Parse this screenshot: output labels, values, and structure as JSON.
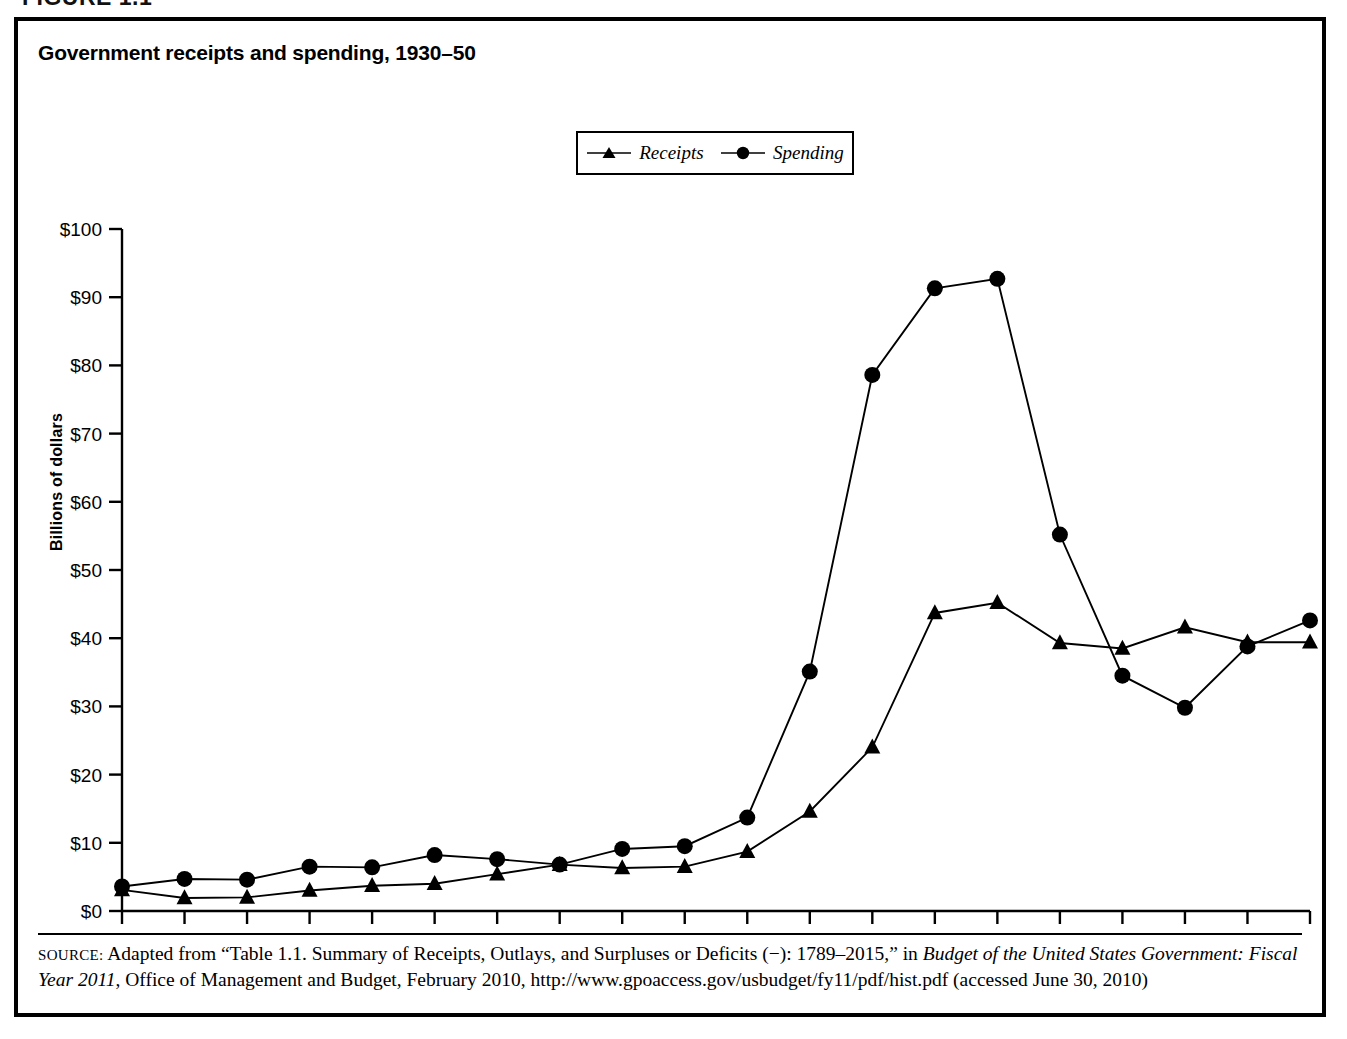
{
  "figure": {
    "number_label": "FIGURE 1.1",
    "title": "Government receipts and spending, 1930–50"
  },
  "legend": {
    "position": "top-center",
    "entries": [
      {
        "label": "Receipts",
        "marker": "triangle-marker-icon"
      },
      {
        "label": "Spending",
        "marker": "circle-marker-icon"
      }
    ]
  },
  "axes": {
    "y_label": "Billions of dollars",
    "y_ticks": [
      "$0",
      "$10",
      "$20",
      "$30",
      "$40",
      "$50",
      "$60",
      "$70",
      "$80",
      "$90",
      "$100"
    ],
    "x_ticks": [
      "1931",
      "1932",
      "1933",
      "1934",
      "1935",
      "1936",
      "1937",
      "1938",
      "1939",
      "1940",
      "1941",
      "1942",
      "1943",
      "1944",
      "1945",
      "1946",
      "1947",
      "1948",
      "1949",
      "1950"
    ]
  },
  "source": {
    "label": "SOURCE:",
    "line1_a": " Adapted from “Table 1.1. Summary of Receipts, Outlays, and Surpluses or Deficits (−): 1789–2015,” in ",
    "line1_italic": "Budget of the United States Government:",
    "line2_italic": "Fiscal Year 2011",
    "line2_b": ", Office of Management and Budget, February 2010, http://www.gpoaccess.gov/usbudget/fy11/pdf/hist.pdf (accessed June 30, 2010)"
  },
  "colors": {
    "line": "#000000",
    "marker": "#000000",
    "frame": "#000000",
    "background": "#ffffff"
  },
  "chart_data": {
    "type": "line",
    "title": "Government receipts and spending, 1930–50",
    "xlabel": "",
    "ylabel": "Billions of dollars",
    "xlim": [
      1931,
      1950
    ],
    "ylim": [
      0,
      100
    ],
    "ytick_step": 10,
    "grid": false,
    "legend_position": "top-center",
    "x": [
      1931,
      1932,
      1933,
      1934,
      1935,
      1936,
      1937,
      1938,
      1939,
      1940,
      1941,
      1942,
      1943,
      1944,
      1945,
      1946,
      1947,
      1948,
      1949,
      1950
    ],
    "series": [
      {
        "name": "Receipts",
        "marker": "triangle",
        "values": [
          3.1,
          1.9,
          2.0,
          3.0,
          3.7,
          4.0,
          5.4,
          6.8,
          6.3,
          6.5,
          8.7,
          14.6,
          24.0,
          43.7,
          45.2,
          39.3,
          38.5,
          41.6,
          39.4,
          39.4
        ]
      },
      {
        "name": "Spending",
        "marker": "circle",
        "values": [
          3.6,
          4.7,
          4.6,
          6.5,
          6.4,
          8.2,
          7.6,
          6.8,
          9.1,
          9.5,
          13.7,
          35.1,
          78.6,
          91.3,
          92.7,
          55.2,
          34.5,
          29.8,
          38.8,
          42.6
        ]
      }
    ]
  }
}
